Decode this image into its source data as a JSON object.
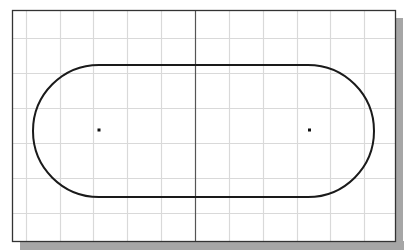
{
  "drawing": {
    "title": "",
    "background_color": "#ffffff",
    "shadow_color": "#a6a6a6",
    "frame": {
      "x": 12,
      "y": 10,
      "width": 383,
      "height": 231,
      "stroke": "#333333"
    },
    "grid": {
      "stroke": "#d9d9d9",
      "vertical_x": [
        26,
        60,
        93,
        127,
        161,
        229,
        263,
        297,
        330,
        364
      ],
      "horizontal_y": [
        38,
        73,
        108,
        143,
        178,
        213
      ]
    },
    "axis": {
      "x": 195,
      "stroke": "#555555"
    },
    "slot": {
      "left_center": {
        "x": 99,
        "y": 131
      },
      "right_center": {
        "x": 308,
        "y": 131
      },
      "radius": 66,
      "stroke": "#1a1a1a",
      "stroke_width": 2
    },
    "center_points": [
      {
        "name": "left-center-point",
        "x": 99,
        "y": 130
      },
      {
        "name": "right-center-point",
        "x": 309.5,
        "y": 130
      }
    ]
  }
}
